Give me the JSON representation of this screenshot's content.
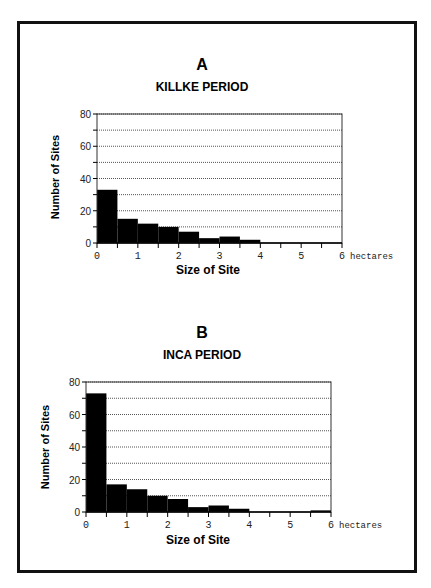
{
  "chart_data": [
    {
      "type": "bar",
      "panel": "A",
      "title": "KILLKE PERIOD",
      "xlabel": "Size of Site",
      "ylabel": "Number of Sites",
      "x_unit": "hectares",
      "x_bin_edges": [
        0,
        0.5,
        1,
        1.5,
        2,
        2.5,
        3,
        3.5,
        4,
        4.5,
        5,
        5.5,
        6
      ],
      "categories": [
        "0-0.5",
        "0.5-1",
        "1-1.5",
        "1.5-2",
        "2-2.5",
        "2.5-3",
        "3-3.5",
        "3.5-4",
        "4-4.5",
        "4.5-5",
        "5-5.5",
        "5.5-6"
      ],
      "values": [
        33,
        15,
        12,
        10,
        7,
        3,
        4,
        2,
        0,
        0,
        0,
        0
      ],
      "xlim": [
        0,
        6
      ],
      "ylim": [
        0,
        80
      ],
      "x_ticks": [
        "0",
        "1",
        "2",
        "3",
        "4",
        "5",
        "6"
      ],
      "y_ticks": [
        "0",
        "20",
        "40",
        "60",
        "80"
      ],
      "grid": "horizontal dotted every 10"
    },
    {
      "type": "bar",
      "panel": "B",
      "title": "INCA PERIOD",
      "xlabel": "Size of Site",
      "ylabel": "Number of Sites",
      "x_unit": "hectares",
      "x_bin_edges": [
        0,
        0.5,
        1,
        1.5,
        2,
        2.5,
        3,
        3.5,
        4,
        4.5,
        5,
        5.5,
        6
      ],
      "categories": [
        "0-0.5",
        "0.5-1",
        "1-1.5",
        "1.5-2",
        "2-2.5",
        "2.5-3",
        "3-3.5",
        "3.5-4",
        "4-4.5",
        "4.5-5",
        "5-5.5",
        "5.5-6"
      ],
      "values": [
        73,
        17,
        14,
        10,
        8,
        3,
        4,
        2,
        0,
        0,
        0,
        1
      ],
      "xlim": [
        0,
        6
      ],
      "ylim": [
        0,
        80
      ],
      "x_ticks": [
        "0",
        "1",
        "2",
        "3",
        "4",
        "5",
        "6"
      ],
      "y_ticks": [
        "0",
        "20",
        "40",
        "60",
        "80"
      ],
      "grid": "horizontal dotted every 10"
    }
  ],
  "panels": {
    "a": {
      "letter": "A",
      "title": "KILLKE PERIOD",
      "ylabel": "Number of Sites",
      "xlabel": "Size of Site",
      "unit": "hectares"
    },
    "b": {
      "letter": "B",
      "title": "INCA PERIOD",
      "ylabel": "Number of Sites",
      "xlabel": "Size of Site",
      "unit": "hectares"
    }
  },
  "colors": {
    "bar": "#000000",
    "grid": "#555555",
    "axis": "#333333",
    "frame": "#111111"
  }
}
